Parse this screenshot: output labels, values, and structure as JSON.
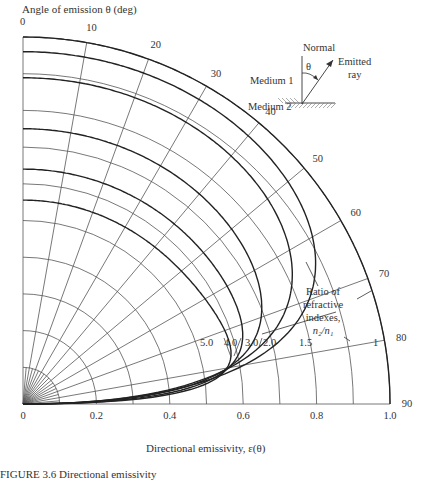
{
  "chart_data": {
    "type": "line",
    "subtype": "polar-quadrant",
    "title": "",
    "theta_axis_label": "Angle of emission θ (deg)",
    "radial_axis_label": "Directional emissivity, ε(θ)",
    "theta_ticks": [
      0,
      10,
      20,
      30,
      40,
      50,
      60,
      70,
      80,
      90
    ],
    "radial_ticks": [
      "0",
      "0.2",
      "0.4",
      "0.6",
      "0.8",
      "1.0"
    ],
    "radial_range": [
      0,
      1.0
    ],
    "grid": true,
    "series_parameter_label": "Ratio of refractive indexes, n2/n1",
    "series": [
      {
        "name": "1",
        "n_ratio": 1.0,
        "label": "1",
        "emissivity_at_0": 1.0
      },
      {
        "name": "1.5",
        "n_ratio": 1.5,
        "label": "1.5",
        "emissivity_at_0": 0.96
      },
      {
        "name": "2.0",
        "n_ratio": 2.0,
        "label": "2.0",
        "emissivity_at_0": 0.889
      },
      {
        "name": "3.0",
        "n_ratio": 3.0,
        "label": "3.0",
        "emissivity_at_0": 0.75
      },
      {
        "name": "4.0",
        "n_ratio": 4.0,
        "label": "4.0",
        "emissivity_at_0": 0.64
      },
      {
        "name": "5.0",
        "n_ratio": 5.0,
        "label": "5.0",
        "emissivity_at_0": 0.556
      }
    ]
  },
  "annotation": {
    "label_line1": "Ratio of",
    "label_line2": "refractive",
    "label_line3": "indexes,",
    "label_line4": "n₂/n₁"
  },
  "inset": {
    "normal": "Normal",
    "theta": "θ",
    "emitted_line1": "Emitted",
    "emitted_line2": "ray",
    "medium1": "Medium 1",
    "medium2": "Medium 2"
  },
  "caption": "FIGURE 3.6   Directional emissivity"
}
